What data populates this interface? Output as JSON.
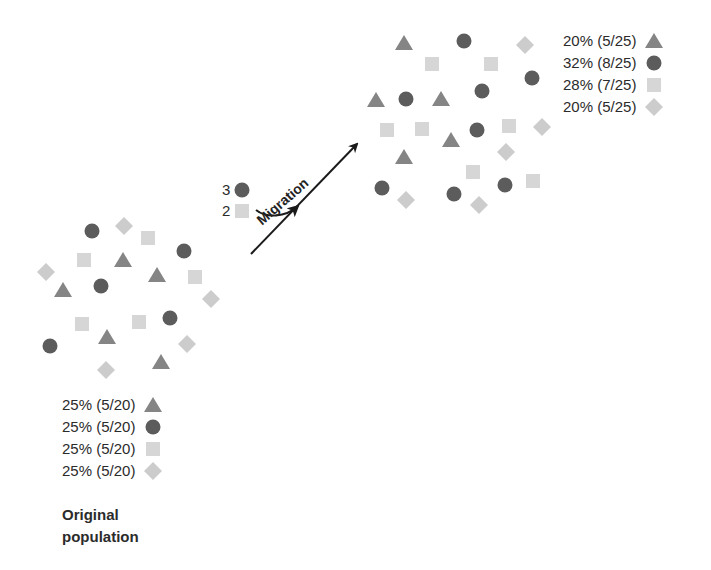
{
  "colors": {
    "triangle": "#858585",
    "circle": "#5c5c5c",
    "square": "#d6d6d6",
    "diamond": "#cccccc",
    "text": "#2b2b2b",
    "arrow": "#1a1a1a"
  },
  "original_population": {
    "caption_line1": "Original",
    "caption_line2": "population",
    "legend": [
      {
        "shape": "triangle",
        "label": "25% (5/20)"
      },
      {
        "shape": "circle",
        "label": "25% (5/20)"
      },
      {
        "shape": "square",
        "label": "25% (5/20)"
      },
      {
        "shape": "diamond",
        "label": "25% (5/20)"
      }
    ],
    "items": [
      {
        "shape": "circle",
        "x": 92,
        "y": 231
      },
      {
        "shape": "diamond",
        "x": 124,
        "y": 226
      },
      {
        "shape": "square",
        "x": 148,
        "y": 238
      },
      {
        "shape": "circle",
        "x": 184,
        "y": 251
      },
      {
        "shape": "square",
        "x": 84,
        "y": 260
      },
      {
        "shape": "triangle",
        "x": 123,
        "y": 260
      },
      {
        "shape": "diamond",
        "x": 46,
        "y": 272
      },
      {
        "shape": "triangle",
        "x": 157,
        "y": 275
      },
      {
        "shape": "square",
        "x": 195,
        "y": 277
      },
      {
        "shape": "triangle",
        "x": 63,
        "y": 290
      },
      {
        "shape": "circle",
        "x": 101,
        "y": 286
      },
      {
        "shape": "diamond",
        "x": 211,
        "y": 299
      },
      {
        "shape": "square",
        "x": 82,
        "y": 324
      },
      {
        "shape": "square",
        "x": 139,
        "y": 322
      },
      {
        "shape": "circle",
        "x": 170,
        "y": 318
      },
      {
        "shape": "triangle",
        "x": 107,
        "y": 337
      },
      {
        "shape": "circle",
        "x": 50,
        "y": 346
      },
      {
        "shape": "diamond",
        "x": 187,
        "y": 344
      },
      {
        "shape": "diamond",
        "x": 106,
        "y": 370
      },
      {
        "shape": "triangle",
        "x": 161,
        "y": 362
      }
    ]
  },
  "migrants": {
    "label": "Migration",
    "items": [
      {
        "shape": "circle",
        "count": "3"
      },
      {
        "shape": "square",
        "count": "2"
      }
    ]
  },
  "new_population": {
    "legend": [
      {
        "shape": "triangle",
        "label": "20% (5/25)"
      },
      {
        "shape": "circle",
        "label": "32% (8/25)"
      },
      {
        "shape": "square",
        "label": "28% (7/25)"
      },
      {
        "shape": "diamond",
        "label": "20% (5/25)"
      }
    ],
    "items": [
      {
        "shape": "triangle",
        "x": 404,
        "y": 43
      },
      {
        "shape": "circle",
        "x": 464,
        "y": 41
      },
      {
        "shape": "diamond",
        "x": 525,
        "y": 45
      },
      {
        "shape": "square",
        "x": 432,
        "y": 64
      },
      {
        "shape": "square",
        "x": 491,
        "y": 64
      },
      {
        "shape": "circle",
        "x": 532,
        "y": 78
      },
      {
        "shape": "triangle",
        "x": 376,
        "y": 100
      },
      {
        "shape": "circle",
        "x": 406,
        "y": 99
      },
      {
        "shape": "triangle",
        "x": 441,
        "y": 99
      },
      {
        "shape": "circle",
        "x": 482,
        "y": 91
      },
      {
        "shape": "square",
        "x": 387,
        "y": 130
      },
      {
        "shape": "square",
        "x": 422,
        "y": 129
      },
      {
        "shape": "triangle",
        "x": 451,
        "y": 140
      },
      {
        "shape": "circle",
        "x": 477,
        "y": 130
      },
      {
        "shape": "square",
        "x": 509,
        "y": 126
      },
      {
        "shape": "diamond",
        "x": 542,
        "y": 127
      },
      {
        "shape": "triangle",
        "x": 404,
        "y": 157
      },
      {
        "shape": "diamond",
        "x": 506,
        "y": 152
      },
      {
        "shape": "square",
        "x": 473,
        "y": 172
      },
      {
        "shape": "square",
        "x": 533,
        "y": 181
      },
      {
        "shape": "circle",
        "x": 382,
        "y": 188
      },
      {
        "shape": "diamond",
        "x": 406,
        "y": 200
      },
      {
        "shape": "circle",
        "x": 454,
        "y": 194
      },
      {
        "shape": "diamond",
        "x": 479,
        "y": 205
      },
      {
        "shape": "circle",
        "x": 505,
        "y": 185
      }
    ]
  }
}
